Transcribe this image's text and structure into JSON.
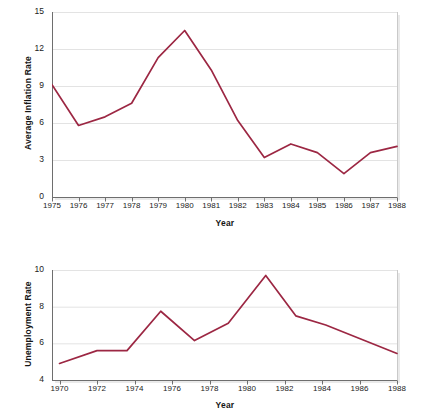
{
  "figures": [
    {
      "id": "inflation",
      "ylabel": "Average Inflation Rate",
      "xlabel": "Year"
    },
    {
      "id": "unemployment",
      "ylabel": "Unemployment Rate",
      "xlabel": "Year"
    }
  ],
  "colors": {
    "line": "#9c2743",
    "grid": "#e3e3e3",
    "axis": "#6e6e6e",
    "plot_border": "#c9c9c9",
    "text": "#1b1b1b",
    "background": "#ffffff"
  },
  "chart_data": [
    {
      "type": "line",
      "title": "",
      "xlabel": "Year",
      "ylabel": "Average Inflation Rate",
      "xlim": [
        1975,
        1988
      ],
      "ylim": [
        0,
        15
      ],
      "yticks": [
        0,
        3,
        6,
        9,
        12,
        15
      ],
      "ytick_labels": [
        "0",
        "3",
        "6",
        "9",
        "12",
        "15"
      ],
      "xticks": [
        1975,
        1976,
        1977,
        1978,
        1979,
        1980,
        1981,
        1982,
        1983,
        1984,
        1985,
        1986,
        1987,
        1988
      ],
      "xtick_labels": [
        "1975",
        "1976",
        "1977",
        "1978",
        "1979",
        "1980",
        "1981",
        "1982",
        "1983",
        "1984",
        "1985",
        "1986",
        "1987",
        "1988"
      ],
      "grid": "horizontal",
      "legend": "none",
      "x": [
        1975,
        1976,
        1977,
        1978,
        1979,
        1980,
        1981,
        1982,
        1983,
        1984,
        1985,
        1986,
        1987,
        1988
      ],
      "values": [
        9.1,
        5.8,
        6.5,
        7.6,
        11.3,
        13.5,
        10.3,
        6.2,
        3.2,
        4.3,
        3.6,
        1.9,
        3.6,
        4.1
      ],
      "series": [
        {
          "name": "Average Inflation Rate",
          "values": [
            9.1,
            5.8,
            6.5,
            7.6,
            11.3,
            13.5,
            10.3,
            6.2,
            3.2,
            4.3,
            3.6,
            1.9,
            3.6,
            4.1
          ]
        }
      ]
    },
    {
      "type": "line",
      "title": "",
      "xlabel": "Year",
      "ylabel": "Unemployment Rate",
      "xlim": [
        1969.6,
        1988
      ],
      "ylim": [
        4,
        10
      ],
      "yticks": [
        4,
        6,
        8,
        10
      ],
      "ytick_labels": [
        "4",
        "6",
        "8",
        "10"
      ],
      "xticks": [
        1970,
        1972,
        1974,
        1976,
        1978,
        1980,
        1982,
        1984,
        1986,
        1988
      ],
      "xtick_labels": [
        "1970",
        "1972",
        "1974",
        "1976",
        "1978",
        "1980",
        "1982",
        "1984",
        "1986",
        "1988"
      ],
      "grid": "horizontal",
      "legend": "none",
      "x": [
        1970,
        1972,
        1973.6,
        1975.4,
        1977.2,
        1979,
        1981,
        1982.6,
        1984.2,
        1988
      ],
      "values": [
        4.9,
        5.6,
        5.6,
        7.75,
        6.15,
        7.1,
        9.7,
        7.5,
        7.0,
        5.45
      ],
      "series": [
        {
          "name": "Unemployment Rate",
          "values": [
            4.9,
            5.6,
            5.6,
            7.75,
            6.15,
            7.1,
            9.7,
            7.5,
            7.0,
            5.45
          ]
        }
      ]
    }
  ]
}
